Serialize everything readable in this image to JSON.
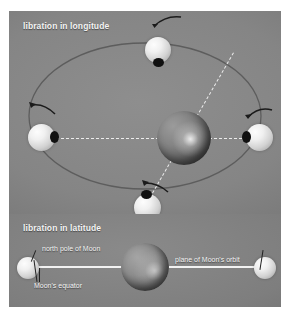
{
  "figure": {
    "width": 290,
    "height": 319,
    "background_color": "#ffffff"
  },
  "panels": [
    {
      "id": "longitude",
      "title": "libration in longitude",
      "title_color": "#f4f4f4",
      "background_color": "#858585"
    },
    {
      "id": "latitude",
      "title": "libration in latitude",
      "title_color": "#f4f4f4",
      "background_color": "#7e7e7e"
    }
  ],
  "longitude_panel": {
    "title": "libration in longitude",
    "earth": {
      "name": "Earth",
      "color": "#7a7a7a"
    },
    "moons": [
      {
        "position": "top",
        "marker_side": "bottom"
      },
      {
        "position": "left",
        "marker_side": "right"
      },
      {
        "position": "right",
        "marker_side": "left"
      },
      {
        "position": "bottom",
        "marker_side": "top"
      }
    ],
    "rotation_arrows": [
      {
        "position": "top",
        "direction": "counterclockwise"
      },
      {
        "position": "left",
        "direction": "counterclockwise"
      },
      {
        "position": "right",
        "direction": "counterclockwise"
      },
      {
        "position": "bottom",
        "direction": "counterclockwise"
      }
    ],
    "orbit": {
      "shape": "ellipse",
      "color": "#5f5f5f"
    },
    "sight_lines": {
      "style": "dashed",
      "color": "#f2f2f2",
      "count": 4
    }
  },
  "latitude_panel": {
    "title": "libration in latitude",
    "earth": {
      "name": "Earth",
      "color": "#6e6e6e"
    },
    "labels": {
      "north_pole": "north pole of Moon",
      "orbit_plane": "plane of Moon's orbit",
      "equator": "Moon's equator"
    },
    "moons": [
      {
        "position": "left",
        "tilt": "north-pole-tilted-away"
      },
      {
        "position": "right",
        "tilt": "north-pole-tilted-toward"
      }
    ],
    "orbit_plane_line": {
      "style": "solid",
      "color": "#f2f2f2"
    }
  },
  "colors": {
    "panel_gray": "#858585",
    "panel_gray_lower": "#7e7e7e",
    "text_white": "#f4f4f4",
    "moon_light": "#f0f0f0",
    "marker_dark": "#111111",
    "orbit_stroke": "#5f5f5f",
    "page_white": "#ffffff"
  }
}
